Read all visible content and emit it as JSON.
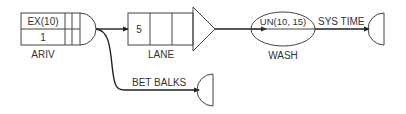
{
  "diagram": {
    "type": "simulation-network-flow",
    "nodes": [
      {
        "id": "ariv",
        "kind": "source",
        "label": "ARIV",
        "top_text": "EX(10)",
        "bottom_text": "1"
      },
      {
        "id": "lane",
        "kind": "queue",
        "label": "LANE",
        "cell_text": "5"
      },
      {
        "id": "wash",
        "kind": "activity",
        "label": "WASH",
        "text": "UN(10, 15)"
      },
      {
        "id": "sink-sys-time",
        "kind": "sink",
        "label": ""
      },
      {
        "id": "sink-bet-balks",
        "kind": "sink",
        "label": ""
      }
    ],
    "edges": [
      {
        "from": "ariv",
        "to": "lane",
        "label": ""
      },
      {
        "from": "lane",
        "to": "wash",
        "label": ""
      },
      {
        "from": "wash",
        "to": "sink-sys-time",
        "label": "SYS TIME"
      },
      {
        "from": "ariv",
        "to": "sink-bet-balks",
        "label": "BET BALKS"
      }
    ],
    "colors": {
      "line": "#333333",
      "background": "#ffffff"
    }
  }
}
